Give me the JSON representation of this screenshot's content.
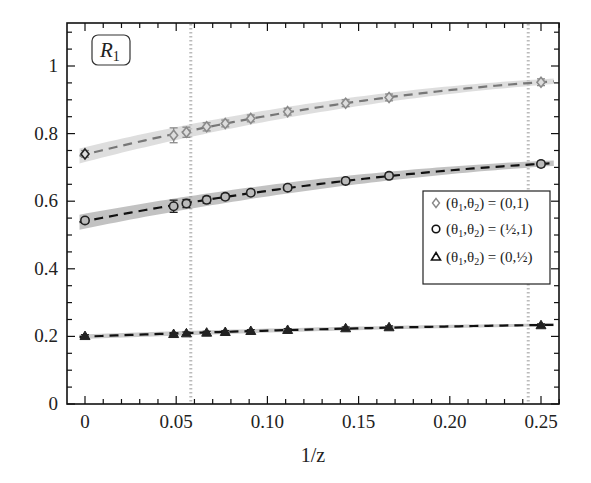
{
  "chart_data": {
    "type": "line",
    "title": "",
    "panel_label": {
      "main": "R",
      "sub": "1"
    },
    "xlabel": "1/z",
    "ylabel": "",
    "xlim": [
      -0.008,
      0.262
    ],
    "ylim": [
      0,
      1.1
    ],
    "x_ticks": [
      0,
      0.05,
      0.1,
      0.15,
      0.2,
      0.25
    ],
    "x_tick_labels": [
      "0",
      "0.05",
      "0.10",
      "0.15",
      "0.20",
      "0.25"
    ],
    "y_ticks": [
      0,
      0.2,
      0.4,
      0.6,
      0.8,
      1
    ],
    "y_tick_labels": [
      "0",
      "0.2",
      "0.4",
      "0.6",
      "0.8",
      "1"
    ],
    "grid": false,
    "vertical_reference_lines": [
      0.058,
      0.243
    ],
    "legend_position": "right-center",
    "x": [
      0,
      0.0486,
      0.0556,
      0.0667,
      0.0769,
      0.0909,
      0.1111,
      0.1429,
      0.1667,
      0.25
    ],
    "series": [
      {
        "name": "(θ1,θ2) = (0,1)",
        "legend": {
          "lhs": "(θ",
          "s1": "1",
          "mid": ",θ",
          "s2": "2",
          "rhs": ") = (0,1)"
        },
        "marker": "diamond",
        "color": "#8a8a8a",
        "band_color": "#c8c8c8",
        "values": [
          0.74,
          0.795,
          0.804,
          0.82,
          0.83,
          0.845,
          0.865,
          0.89,
          0.907,
          0.952
        ],
        "errors": [
          0.01,
          0.022,
          0.015,
          0.012,
          0.01,
          0.01,
          0.01,
          0.01,
          0.01,
          0.01
        ]
      },
      {
        "name": "(θ1,θ2) = (1/2,1)",
        "legend": {
          "lhs": "(θ",
          "s1": "1",
          "mid": ",θ",
          "s2": "2",
          "rhs": ") = (½,1)"
        },
        "marker": "circle",
        "color": "#222222",
        "band_color": "#9a9a9a",
        "values": [
          0.543,
          0.585,
          0.593,
          0.604,
          0.613,
          0.625,
          0.64,
          0.66,
          0.675,
          0.71
        ],
        "errors": [
          0.008,
          0.018,
          0.012,
          0.01,
          0.008,
          0.008,
          0.008,
          0.008,
          0.008,
          0.008
        ]
      },
      {
        "name": "(θ1,θ2) = (0,1/2)",
        "legend": {
          "lhs": "(θ",
          "s1": "1",
          "mid": ",θ",
          "s2": "2",
          "rhs": ") = (0,½)"
        },
        "marker": "triangle",
        "color": "#222222",
        "band_color": "#a8a8a8",
        "values": [
          0.201,
          0.207,
          0.209,
          0.211,
          0.213,
          0.216,
          0.219,
          0.224,
          0.227,
          0.233
        ],
        "errors": [
          0.004,
          0.004,
          0.004,
          0.004,
          0.004,
          0.004,
          0.004,
          0.004,
          0.004,
          0.004
        ]
      }
    ]
  }
}
